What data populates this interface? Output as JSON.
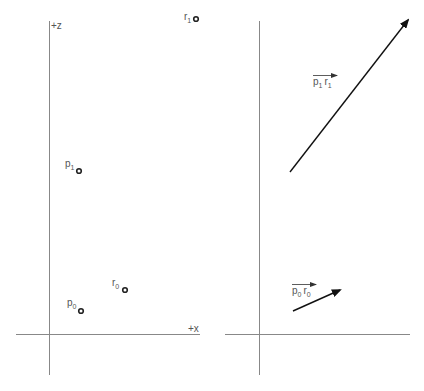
{
  "left_panel": {
    "axes": {
      "z_label": "+z",
      "x_label": "+x"
    },
    "points": [
      {
        "name": "r",
        "sub": "1",
        "x": 196,
        "y": 19
      },
      {
        "name": "p",
        "sub": "1",
        "x": 79,
        "y": 171
      },
      {
        "name": "r",
        "sub": "0",
        "x": 125,
        "y": 290
      },
      {
        "name": "p",
        "sub": "0",
        "x": 81,
        "y": 311
      }
    ]
  },
  "right_panel": {
    "vectors": [
      {
        "from_name": "p",
        "from_sub": "1",
        "to_name": "r",
        "to_sub": "1",
        "x1": 290,
        "y1": 172,
        "x2": 410,
        "y2": 18
      },
      {
        "from_name": "p",
        "from_sub": "0",
        "to_name": "r",
        "to_sub": "0",
        "x1": 293,
        "y1": 311,
        "x2": 342,
        "y2": 289
      }
    ]
  },
  "colors": {
    "axis": "#888888",
    "point": "#222222",
    "vector": "#111111",
    "label": "#555555"
  }
}
